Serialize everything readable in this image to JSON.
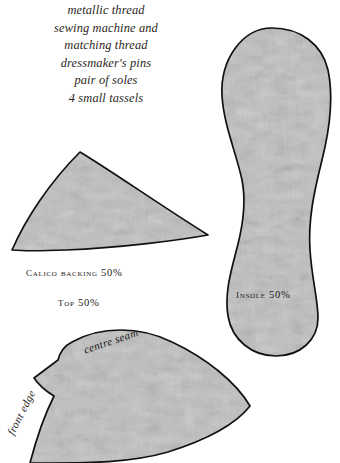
{
  "materials": {
    "lines": [
      "metallic thread",
      "sewing machine and",
      "matching thread",
      "dressmaker's pins",
      "pair of soles",
      "4 small tassels"
    ]
  },
  "pattern_pieces": [
    {
      "id": "top-wedge",
      "labels": [
        "Calico Backing 50%",
        "Top 50%"
      ],
      "fill": "#c9c9c9"
    },
    {
      "id": "insole",
      "labels": [
        "Insole 50%"
      ],
      "fill": "#c9c9c9"
    },
    {
      "id": "upper",
      "labels": [
        "centre seam",
        "front edge"
      ],
      "fill": "#c9c9c9"
    }
  ],
  "labels": {
    "calico_backing": "Calico Backing 50%",
    "top": "Top 50%",
    "insole": "Insole 50%",
    "centre_seam": "centre seam",
    "front_edge": "front edge"
  },
  "colors": {
    "background": "#ffffff",
    "fabric_fill": "#c9c9c9",
    "outline": "#121010",
    "text": "#262220"
  }
}
